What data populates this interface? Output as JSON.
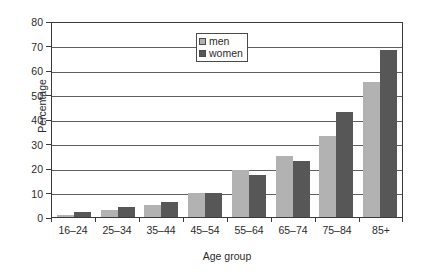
{
  "chart_data": {
    "type": "bar",
    "title": "",
    "subtitle": "",
    "xlabel": "Age group",
    "ylabel": "Percentage",
    "categories": [
      "16–24",
      "25–34",
      "35–44",
      "45–54",
      "55–64",
      "65–74",
      "75–84",
      "85+"
    ],
    "series": [
      {
        "name": "men",
        "color": "#b2b2b2",
        "values": [
          1,
          3,
          5,
          10,
          19,
          25,
          33,
          55
        ]
      },
      {
        "name": "women",
        "color": "#575757",
        "values": [
          2,
          4,
          6,
          10,
          17,
          23,
          43,
          68
        ]
      }
    ],
    "ylim": [
      0,
      80
    ],
    "ytick_values": [
      0,
      10,
      20,
      30,
      40,
      50,
      60,
      70,
      80
    ],
    "ytick_labels": [
      "0",
      "10",
      "20",
      "30",
      "40",
      "50",
      "60",
      "70",
      "80"
    ],
    "grid": "horizontal",
    "legend_position": "top-center",
    "legend_entries": [
      "men",
      "women"
    ],
    "annotations": []
  },
  "axes": {
    "frame_color": "#3a3a3a",
    "grid_color": "#5f5f5f",
    "background": "#ffffff"
  }
}
